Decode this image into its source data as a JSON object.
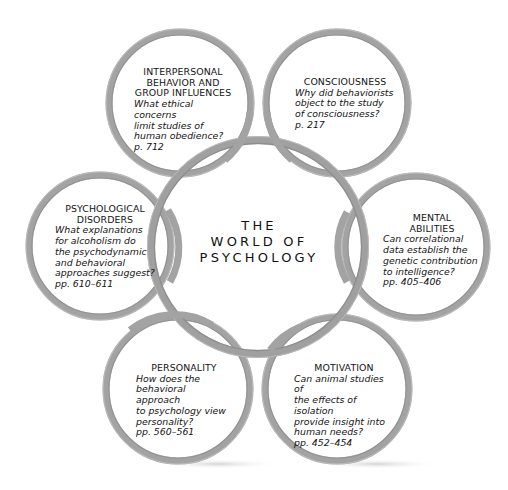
{
  "diagram": {
    "center": {
      "lines": [
        "THE",
        "WORLD OF",
        "PSYCHOLOGY"
      ]
    },
    "ring_color": "#a3a3a3",
    "ring_highlight": "#c9c9c9",
    "ring_shadow": "#7d7d7d",
    "nodes": [
      {
        "id": "interpersonal",
        "title": "INTERPERSONAL\nBEHAVIOR AND\nGROUP INFLUENCES",
        "question": "What ethical concerns\nlimit studies of\nhuman obedience?",
        "pages": "p. 712"
      },
      {
        "id": "consciousness",
        "title": "CONSCIOUSNESS",
        "question": "Why did behaviorists\nobject to the study\nof consciousness?",
        "pages": "p. 217"
      },
      {
        "id": "psychological-disorders",
        "title": "PSYCHOLOGICAL\nDISORDERS",
        "question": "What explanations\nfor alcoholism do\nthe psychodynamic\nand behavioral\napproaches suggest?",
        "pages": "pp. 610–611"
      },
      {
        "id": "mental-abilities",
        "title": "MENTAL\nABILITIES",
        "question": "Can correlational\ndata establish the\ngenetic contribution\nto intelligence?",
        "pages": "pp. 405–406"
      },
      {
        "id": "personality",
        "title": "PERSONALITY",
        "question": "How does the\nbehavioral approach\nto psychology view\npersonality?",
        "pages": "pp. 560–561"
      },
      {
        "id": "motivation",
        "title": "MOTIVATION",
        "question": "Can animal studies of\nthe effects of isolation\nprovide insight into\nhuman needs?",
        "pages": "pp. 452–454"
      }
    ]
  }
}
